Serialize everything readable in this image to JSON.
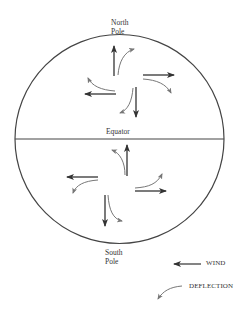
{
  "diagram": {
    "labels": {
      "north_pole_line1": "North",
      "north_pole_line2": "Pole",
      "equator": "Equator",
      "south_pole_line1": "South",
      "south_pole_line2": "Pole"
    },
    "legend": {
      "wind_label": "WIND",
      "deflection_label": "DEFLECTION"
    },
    "colors": {
      "outline": "#444444",
      "wind_arrow": "#333333",
      "deflection_arrow": "#777777"
    },
    "globe": {
      "cx": 119.5,
      "cy": 139,
      "r": 104.5
    },
    "northern_hemisphere": {
      "deflection_direction": "right",
      "winds": [
        {
          "direction": "north",
          "from": [
            114,
            76
          ],
          "to": [
            114,
            46
          ]
        },
        {
          "direction": "east",
          "from": [
            143,
            75
          ],
          "to": [
            174,
            75
          ]
        },
        {
          "direction": "south",
          "from": [
            136,
            87
          ],
          "to": [
            136,
            117
          ]
        },
        {
          "direction": "west",
          "from": [
            116,
            94
          ],
          "to": [
            85,
            94
          ]
        }
      ]
    },
    "southern_hemisphere": {
      "deflection_direction": "left",
      "winds": [
        {
          "direction": "north",
          "from": [
            127,
            176
          ],
          "to": [
            127,
            145
          ]
        },
        {
          "direction": "east",
          "from": [
            135,
            191
          ],
          "to": [
            166,
            191
          ]
        },
        {
          "direction": "south",
          "from": [
            105,
            195
          ],
          "to": [
            105,
            226
          ]
        },
        {
          "direction": "west",
          "from": [
            98,
            177
          ],
          "to": [
            67,
            177
          ]
        }
      ]
    }
  }
}
